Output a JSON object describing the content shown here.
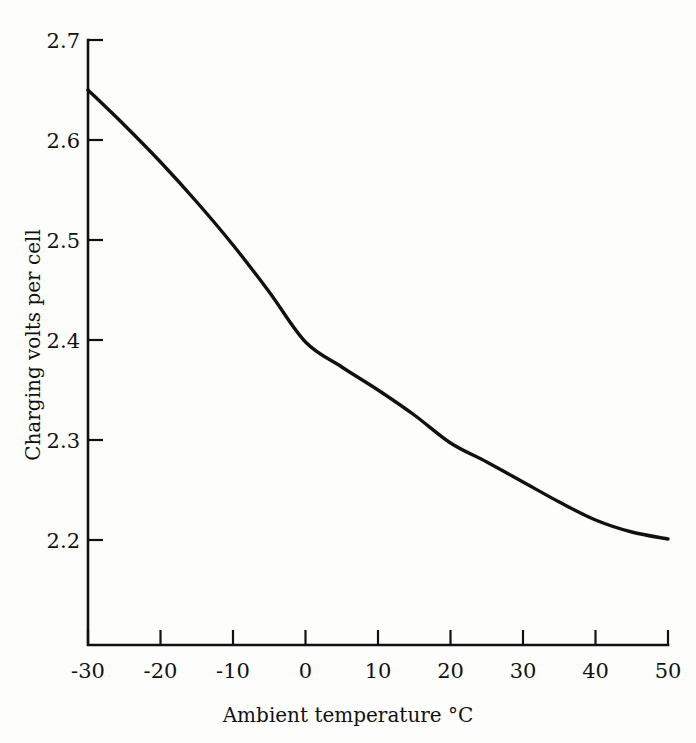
{
  "figure": {
    "background_color": "#fdfdfc",
    "ink_color": "#111111"
  },
  "chart_data": {
    "type": "line",
    "title": "",
    "subtitle": "",
    "xlabel": "Ambient temperature °C",
    "ylabel": "Charging volts per cell",
    "xlim": [
      -30,
      50
    ],
    "ylim": [
      2.15,
      2.7
    ],
    "xticks": [
      -30,
      -20,
      -10,
      0,
      10,
      20,
      30,
      40,
      50
    ],
    "xtick_labels": [
      "-30",
      "-20",
      "-10",
      "0",
      "10",
      "20",
      "30",
      "40",
      "50"
    ],
    "yticks": [
      2.2,
      2.3,
      2.4,
      2.5,
      2.6,
      2.7
    ],
    "ytick_labels": [
      "2.2",
      "2.3",
      "2.4",
      "2.5",
      "2.6",
      "2.7"
    ],
    "grid": false,
    "legend": false,
    "legend_position": "none",
    "x": [
      -30,
      -25,
      -20,
      -15,
      -10,
      -5,
      0,
      5,
      10,
      15,
      20,
      25,
      30,
      35,
      40,
      45,
      50
    ],
    "series": [
      {
        "name": "Charging volts per cell",
        "color": "#111111",
        "values": [
          2.65,
          2.615,
          2.578,
          2.538,
          2.495,
          2.448,
          2.398,
          2.373,
          2.35,
          2.325,
          2.297,
          2.278,
          2.258,
          2.238,
          2.22,
          2.208,
          2.201
        ]
      }
    ]
  },
  "axis": {
    "y_title": "Charging volts per cell",
    "x_title": "Ambient temperature °C"
  }
}
